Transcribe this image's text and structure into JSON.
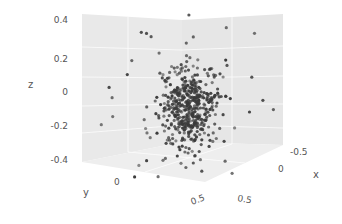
{
  "chart_data": {
    "type": "scatter3d",
    "title": "",
    "xlabel": "x",
    "ylabel": "y",
    "zlabel": "z",
    "x_ticks": [
      "-0.5",
      "0",
      "0.5"
    ],
    "y_ticks": [
      "0",
      "0.5"
    ],
    "z_ticks": [
      "0.4",
      "0.2",
      "0",
      "-0.2",
      "-0.4"
    ],
    "xlim": [
      -0.7,
      0.7
    ],
    "ylim": [
      -0.7,
      0.7
    ],
    "zlim": [
      -0.45,
      0.5
    ],
    "grid": true,
    "legend": null,
    "marker_color": "#3a3a3a",
    "pane_color": "#ebebeb",
    "approx_points": 500,
    "center": [
      0,
      0,
      -0.05
    ],
    "spread_std": [
      0.15,
      0.15,
      0.12
    ]
  },
  "labels": {
    "x": "x",
    "y": "y",
    "z": "z",
    "z_tick_0": "0.4",
    "z_tick_1": "0.2",
    "z_tick_2": "0",
    "z_tick_3": "-0.2",
    "z_tick_4": "-0.4",
    "y_tick_0": "0",
    "y_tick_1": "0.5",
    "x_tick_0": "-0.5",
    "x_tick_1": "0",
    "x_tick_2": "0.5"
  }
}
